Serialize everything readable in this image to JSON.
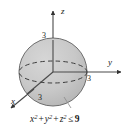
{
  "figure": {
    "equation": {
      "x_var": "x",
      "y_var": "y",
      "z_var": "z",
      "exponent": "2",
      "plus": "+",
      "relation": "≤",
      "value": "9",
      "full": "x² + y² + z² ≤ 9"
    },
    "axes": [
      {
        "name": "z",
        "label": "z",
        "direction": "up"
      },
      {
        "name": "y",
        "label": "y",
        "direction": "right"
      },
      {
        "name": "x",
        "label": "x",
        "direction": "down-left"
      }
    ],
    "ticks": [
      {
        "axis": "z",
        "label": "3"
      },
      {
        "axis": "y",
        "label": "3"
      },
      {
        "axis": "x",
        "label": "3"
      }
    ],
    "colors": {
      "sphere_fill": "#c9c9c9",
      "sphere_stroke": "#6e6e6e",
      "axis_stroke": "#4a4a4a",
      "dashed_stroke": "#3c3c3c",
      "text": "#1a1a1a",
      "background": "#ffffff"
    },
    "geometry": {
      "sphere_center_x": 53,
      "sphere_center_y": 72,
      "sphere_radius": 34,
      "equator_ry": 11
    }
  }
}
